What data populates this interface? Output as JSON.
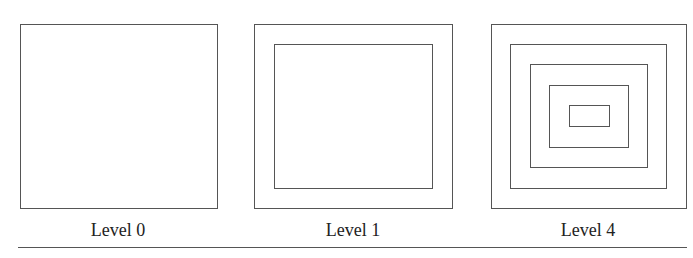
{
  "panels": [
    {
      "label": "Level 0",
      "level": 0
    },
    {
      "label": "Level 1",
      "level": 1
    },
    {
      "label": "Level 4",
      "level": 4
    }
  ],
  "colors": {
    "stroke": "#555555",
    "text": "#222222",
    "background": "#ffffff"
  }
}
